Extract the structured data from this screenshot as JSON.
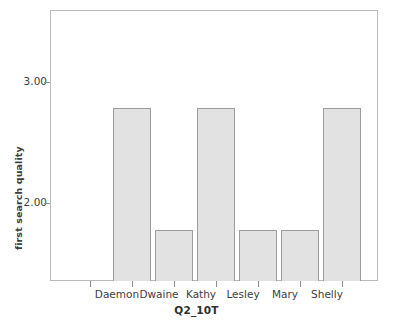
{
  "chart_data": {
    "type": "bar",
    "title": "",
    "subtitle": "",
    "xlabel": "Q2_10T",
    "ylabel": "first search quality",
    "categories": [
      "Daemon",
      "Dwaine",
      "Kathy",
      "Lesley",
      "Mary",
      "Shelly"
    ],
    "values": [
      3.0,
      2.0,
      3.0,
      2.0,
      2.0,
      3.0
    ],
    "value_labels": [
      "3.00",
      "2.00",
      "3.00",
      "2.00",
      "2.00",
      "3.00"
    ],
    "ytick_labels": [
      "2.00",
      "3.00"
    ],
    "ytick_values": [
      2.0,
      3.0
    ],
    "ylim": [
      1.58,
      3.81
    ],
    "grid": false,
    "legend": "none",
    "bar_fill_color": "#e2e2e2",
    "bar_border_color": "#9c9c9c",
    "frame_color": "#b9b9b9",
    "text_color": "#3d3d3d",
    "background_color": "#ffffff"
  }
}
